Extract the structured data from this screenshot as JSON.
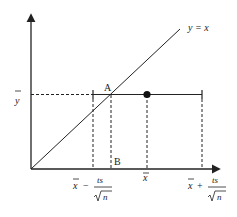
{
  "diagram": {
    "type": "geometric-diagram",
    "line_label": "y = x",
    "point_a_label": "A",
    "point_b_label": "B",
    "y_tick_label": "y",
    "x_center_label": "x",
    "x_left_label": {
      "base": "x",
      "operator": "−",
      "numerator": "ts",
      "denominator": "n"
    },
    "x_right_label": {
      "base": "x",
      "operator": "+",
      "numerator": "ts",
      "denominator": "n"
    },
    "colors": {
      "stroke": "#222222",
      "background": "#ffffff"
    }
  }
}
